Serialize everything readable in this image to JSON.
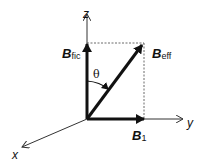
{
  "diagram": {
    "type": "vector-diagram",
    "axes": {
      "x": {
        "label": "x"
      },
      "y": {
        "label": "y"
      },
      "z": {
        "label": "z"
      }
    },
    "vectors": [
      {
        "id": "b-fic",
        "symbol": "B",
        "subscript": "fic",
        "direction": "z"
      },
      {
        "id": "b-eff",
        "symbol": "B",
        "subscript": "eff",
        "direction": "yz"
      },
      {
        "id": "b-1",
        "symbol": "B",
        "subscript": "1",
        "direction": "y"
      }
    ],
    "angle": {
      "label": "θ",
      "between": [
        "B_fic",
        "B_eff"
      ]
    },
    "colors": {
      "ink": "#111111",
      "background": "#ffffff"
    }
  }
}
